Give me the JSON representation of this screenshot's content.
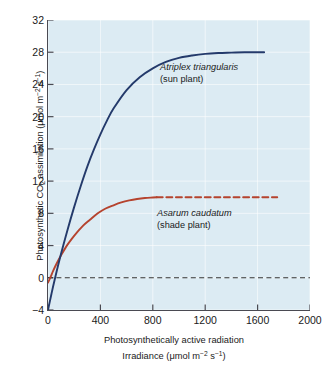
{
  "chart_data": {
    "type": "line",
    "title": "",
    "xlabel": "Photosynthetically active radiation Irradiance (μmol m⁻² s⁻¹)",
    "ylabel": "Photosynthetic CO₂ assimilation (μmol m⁻² s⁻¹)",
    "xlim": [
      0,
      2000
    ],
    "ylim": [
      -4,
      32
    ],
    "xticks": [
      0,
      400,
      800,
      1200,
      1600,
      2000
    ],
    "yticks": [
      -4,
      0,
      4,
      8,
      12,
      16,
      20,
      24,
      28,
      32
    ],
    "grid": true,
    "legend_position": "inline-annotations",
    "background_color": "#dcebf3",
    "zero_line": {
      "value": 0,
      "style": "dashed",
      "color": "#333333"
    },
    "series": [
      {
        "name": "Atriplex triangularis",
        "subtitle": "(sun plant)",
        "color": "#243a6b",
        "style": "solid",
        "light_compensation_point": 40,
        "saturation_irradiance": 1400,
        "max_assimilation": 28,
        "dark_respiration": -4,
        "x": [
          0,
          25,
          50,
          100,
          150,
          200,
          250,
          300,
          350,
          400,
          450,
          500,
          600,
          700,
          800,
          900,
          1000,
          1100,
          1200,
          1300,
          1400,
          1500,
          1650
        ],
        "y": [
          -4.0,
          -2.1,
          -0.3,
          3.0,
          6.0,
          8.8,
          11.4,
          13.8,
          15.9,
          17.8,
          19.5,
          21.0,
          23.3,
          24.9,
          26.0,
          26.8,
          27.3,
          27.6,
          27.8,
          27.9,
          27.95,
          28.0,
          28.0
        ]
      },
      {
        "name": "Asarum caudatum",
        "subtitle": "(shade plant)",
        "color": "#b5432e",
        "style": "solid-then-dashed",
        "light_compensation_point": 12,
        "saturation_irradiance": 780,
        "max_assimilation": 10,
        "dark_respiration": -0.6,
        "dashed_extension_x": [
          830,
          1750
        ],
        "dashed_extension_y": 10,
        "x": [
          0,
          20,
          40,
          70,
          100,
          140,
          180,
          220,
          270,
          320,
          380,
          440,
          500,
          560,
          620,
          680,
          740,
          800,
          830
        ],
        "y": [
          -0.6,
          0.1,
          0.9,
          1.9,
          2.8,
          3.9,
          4.8,
          5.6,
          6.5,
          7.2,
          8.0,
          8.6,
          9.0,
          9.35,
          9.6,
          9.78,
          9.9,
          9.97,
          10.0
        ]
      }
    ],
    "annotations": [
      {
        "text": "Atriplex triangularis",
        "subtitle": "(sun plant)",
        "x": 980,
        "y": 25.5
      },
      {
        "text": "Asarum caudatum",
        "subtitle": "(shade plant)",
        "x": 950,
        "y": 9.0
      }
    ]
  },
  "axes": {
    "y_title": "Photosynthetic CO",
    "y_title_sub": "2",
    "y_title_rest": " assimilation (μmol m",
    "y_title_sup1": "−2",
    "y_title_mid": " s",
    "y_title_sup2": "−1",
    "y_title_end": ")",
    "x_title_line1": "Photosynthetically active radiation",
    "x_title_line2_pre": "Irradiance (μmol m",
    "x_title_sup1": "−2",
    "x_title_mid": " s",
    "x_title_sup2": "−1",
    "x_title_end": ")",
    "y_tick_labels": [
      "32",
      "28",
      "24",
      "20",
      "16",
      "12",
      "8",
      "4",
      "0",
      "−4"
    ],
    "x_tick_labels": [
      "0",
      "400",
      "800",
      "1200",
      "1600",
      "2000"
    ]
  },
  "annotations": {
    "sun_species": "Atriplex triangularis",
    "sun_common": "(sun plant)",
    "shade_species": "Asarum caudatum",
    "shade_common": "(shade plant)"
  }
}
